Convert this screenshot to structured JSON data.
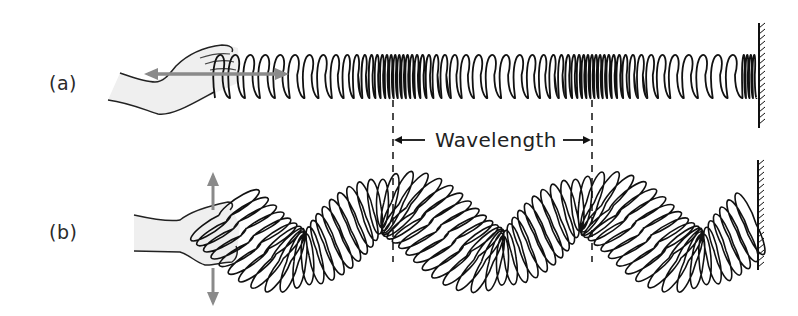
{
  "figure": {
    "panels": [
      {
        "id": "a",
        "label": "(a)",
        "motion": "longitudinal",
        "arrow_direction": "horizontal"
      },
      {
        "id": "b",
        "label": "(b)",
        "motion": "transverse",
        "arrow_direction": "vertical"
      }
    ],
    "annotation": {
      "text": "Wavelength",
      "left_arrow": "left-arrow",
      "right_arrow": "right-arrow"
    },
    "colors": {
      "ink": "#111111",
      "arrow_gray": "#8a8a8a",
      "hand_fill": "#efefef",
      "background": "#ffffff"
    }
  }
}
